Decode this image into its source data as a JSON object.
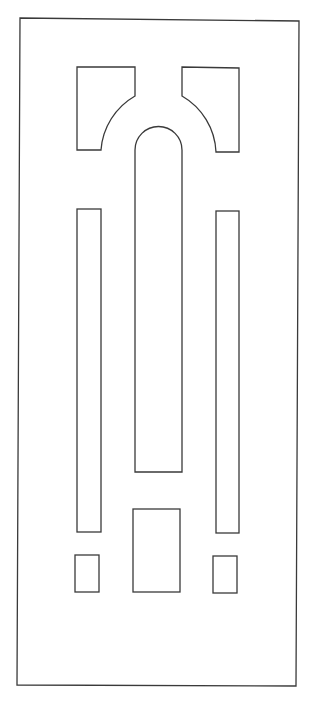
{
  "diagram": {
    "stroke_color": "#3a3a3a",
    "background": "#ffffff",
    "stroke_width": 1.3,
    "frame": {
      "points": "20,18 299,21 296,686 17,685"
    },
    "shapes": [
      {
        "id": "top-left-corner-panel",
        "path": "M77,67 L135,67 L135,96 A68,68 0 0 0 101,150 L77,150 Z"
      },
      {
        "id": "top-right-corner-panel",
        "path": "M182,67 L239,68 L239,152 L216,152 A68,68 0 0 0 182,96 Z"
      },
      {
        "id": "center-arch-panel",
        "path": "M135,472 L135,150 A23.5,23.5 0 0 1 182,150 L182,472 Z"
      },
      {
        "id": "left-tall-panel",
        "rect": {
          "x": 77,
          "y": 209,
          "w": 24,
          "h": 323
        }
      },
      {
        "id": "right-tall-panel",
        "rect": {
          "x": 216,
          "y": 211,
          "w": 23,
          "h": 322
        }
      },
      {
        "id": "center-lower-panel",
        "rect": {
          "x": 133,
          "y": 509,
          "w": 47,
          "h": 83
        }
      },
      {
        "id": "left-small-panel",
        "rect": {
          "x": 75,
          "y": 555,
          "w": 24,
          "h": 37
        }
      },
      {
        "id": "right-small-panel",
        "rect": {
          "x": 213,
          "y": 556,
          "w": 24,
          "h": 37
        }
      }
    ]
  }
}
